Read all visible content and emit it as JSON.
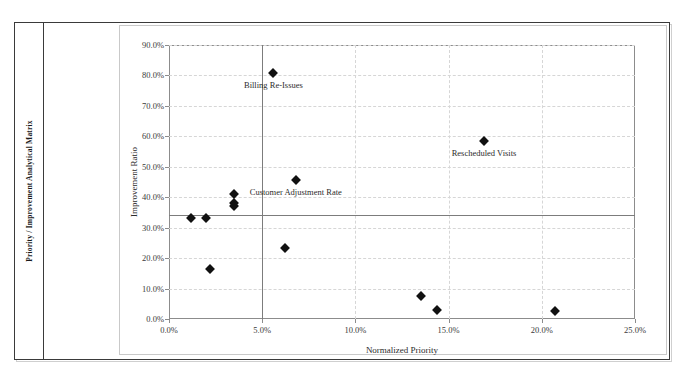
{
  "document": {
    "sidebar_label": "Priority / Improvement Analytical Matrix"
  },
  "chart_data": {
    "type": "scatter",
    "title": "",
    "xlabel": "Normalized Priority",
    "ylabel": "Improvement Ratio",
    "xlim": [
      0,
      25
    ],
    "ylim": [
      0,
      90
    ],
    "xticks": [
      "0.0%",
      "5.0%",
      "10.0%",
      "15.0%",
      "20.0%",
      "25.0%"
    ],
    "xtick_values": [
      0,
      5,
      10,
      15,
      20,
      25
    ],
    "yticks": [
      "0.0%",
      "10.0%",
      "20.0%",
      "30.0%",
      "40.0%",
      "50.0%",
      "60.0%",
      "70.0%",
      "80.0%",
      "90.0%"
    ],
    "ytick_values": [
      0,
      10,
      20,
      30,
      40,
      50,
      60,
      70,
      80,
      90
    ],
    "grid": true,
    "legend": "none",
    "threshold_vertical": 5.0,
    "threshold_horizontal": 34.0,
    "points": [
      {
        "x": 1.2,
        "y": 33.2,
        "label": ""
      },
      {
        "x": 2.0,
        "y": 33.2,
        "label": ""
      },
      {
        "x": 2.2,
        "y": 16.5,
        "label": ""
      },
      {
        "x": 3.5,
        "y": 41.0,
        "label": ""
      },
      {
        "x": 3.5,
        "y": 38.0,
        "label": ""
      },
      {
        "x": 3.5,
        "y": 37.0,
        "label": ""
      },
      {
        "x": 5.6,
        "y": 80.8,
        "label": "Billing Re-Issues"
      },
      {
        "x": 6.2,
        "y": 23.3,
        "label": ""
      },
      {
        "x": 6.8,
        "y": 45.5,
        "label": "Customer Adjustment Rate"
      },
      {
        "x": 13.5,
        "y": 7.6,
        "label": ""
      },
      {
        "x": 14.4,
        "y": 3.1,
        "label": ""
      },
      {
        "x": 16.9,
        "y": 58.5,
        "label": "Rescheduled Visits"
      },
      {
        "x": 20.7,
        "y": 2.6,
        "label": ""
      }
    ]
  }
}
